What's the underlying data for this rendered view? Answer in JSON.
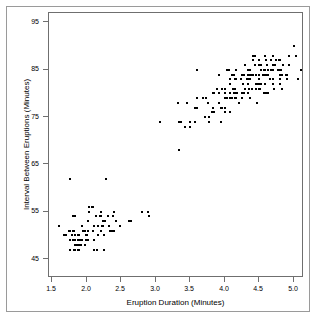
{
  "chart_data": {
    "type": "scatter",
    "title": "",
    "xlabel": "Eruption Duration (Minutes)",
    "ylabel": "Interval Between Eruptions (Minutes)",
    "xlim": [
      1.45,
      5.15
    ],
    "ylim": [
      41,
      97
    ],
    "grid": false,
    "legend": null,
    "marker": "square",
    "marker_color": "#000000",
    "marker_size_px": 2,
    "xticks": [
      1.5,
      2.0,
      2.5,
      3.0,
      3.5,
      4.0,
      4.5,
      5.0
    ],
    "xtick_labels": [
      "1.5",
      "2.0",
      "2.5",
      "3.0",
      "3.5",
      "4.0",
      "4.5",
      "5.0"
    ],
    "yticks": [
      45,
      55,
      65,
      75,
      85,
      95
    ],
    "ytick_labels": [
      "45",
      "55",
      "65",
      "75",
      "85",
      "95"
    ],
    "series": [
      {
        "name": "Old Faithful eruptions",
        "x": [
          3.6,
          1.8,
          3.333,
          2.283,
          4.533,
          2.883,
          4.7,
          3.6,
          1.95,
          4.35,
          1.833,
          3.917,
          4.2,
          1.75,
          4.7,
          2.167,
          1.75,
          4.8,
          1.6,
          4.25,
          1.8,
          1.75,
          3.45,
          3.067,
          4.533,
          3.6,
          1.967,
          4.083,
          3.85,
          4.433,
          4.3,
          4.467,
          3.367,
          4.033,
          3.833,
          2.017,
          1.867,
          4.833,
          1.833,
          4.783,
          4.35,
          1.883,
          4.567,
          1.75,
          4.533,
          3.317,
          3.833,
          2.1,
          4.633,
          2.0,
          4.8,
          4.716,
          1.833,
          4.833,
          1.733,
          4.883,
          3.717,
          1.667,
          4.567,
          4.317,
          2.233,
          4.5,
          1.75,
          4.8,
          1.817,
          4.4,
          4.167,
          4.7,
          2.067,
          4.7,
          4.033,
          1.967,
          4.5,
          4.0,
          1.983,
          5.067,
          2.017,
          4.567,
          3.883,
          3.6,
          4.133,
          4.333,
          4.1,
          2.633,
          4.067,
          4.933,
          3.95,
          4.517,
          2.167,
          4.0,
          2.2,
          4.333,
          1.867,
          4.817,
          1.833,
          4.3,
          4.667,
          3.75,
          1.867,
          4.9,
          2.483,
          4.367,
          2.1,
          4.5,
          4.05,
          1.867,
          4.7,
          1.783,
          4.85,
          3.683,
          4.733,
          2.3,
          4.9,
          4.417,
          1.7,
          4.633,
          2.317,
          4.6,
          1.817,
          4.417,
          2.617,
          4.067,
          4.25,
          1.967,
          4.6,
          3.767,
          1.917,
          4.5,
          2.267,
          4.65,
          1.867,
          4.167,
          2.8,
          4.333,
          1.833,
          4.383,
          1.883,
          4.933,
          2.033,
          3.733,
          4.233,
          2.233,
          4.533,
          4.817,
          4.333,
          1.983,
          4.633,
          2.017,
          5.1,
          1.8,
          5.033,
          4.0,
          2.4,
          4.6,
          3.567,
          4.0,
          4.5,
          4.083,
          1.8,
          3.967,
          2.2,
          4.15,
          2.0,
          3.833,
          3.5,
          4.583,
          2.367,
          5.0,
          1.933,
          4.617,
          1.917,
          2.083,
          4.583,
          3.333,
          4.167,
          4.333,
          4.5,
          2.417,
          4.0,
          4.167,
          1.883,
          4.583,
          4.25,
          3.767,
          2.033,
          4.433,
          4.083,
          1.833,
          4.417,
          2.183,
          4.8,
          1.833,
          4.8,
          4.1,
          3.966,
          4.233,
          3.5,
          4.366,
          2.25,
          4.667,
          2.1,
          4.35,
          4.133,
          1.867,
          4.6,
          1.783,
          4.367,
          3.85,
          1.933,
          4.5,
          2.383,
          4.7,
          1.867,
          3.833,
          3.417,
          4.233,
          2.4,
          4.8,
          2.0,
          4.15,
          1.867,
          4.267,
          1.75,
          4.483,
          4.0,
          4.117,
          4.083,
          4.267,
          3.917,
          4.55,
          4.083,
          2.417,
          4.183,
          2.217,
          4.45,
          1.883,
          1.85,
          4.283,
          3.95,
          2.333,
          4.15,
          2.35,
          4.933,
          2.9,
          4.583,
          3.833,
          2.083,
          4.367,
          2.133,
          4.35,
          2.2,
          4.45,
          3.567,
          4.5,
          4.15,
          3.817,
          3.917,
          4.45,
          2.0,
          4.283,
          4.767,
          4.533,
          1.85,
          4.25,
          1.983,
          2.25,
          4.75,
          4.117,
          2.15,
          4.417,
          1.817,
          4.467
        ],
        "y": [
          79,
          54,
          74,
          62,
          85,
          55,
          88,
          85,
          51,
          85,
          54,
          84,
          78,
          47,
          83,
          52,
          62,
          84,
          52,
          79,
          51,
          47,
          78,
          74,
          85,
          77,
          51,
          80,
          76,
          88,
          81,
          78,
          74,
          79,
          76,
          51,
          47,
          84,
          47,
          87,
          81,
          47,
          80,
          49,
          86,
          78,
          77,
          47,
          80,
          50,
          83,
          81,
          48,
          81,
          51,
          84,
          75,
          50,
          85,
          83,
          52,
          87,
          47,
          85,
          49,
          81,
          83,
          85,
          56,
          86,
          85,
          48,
          81,
          79,
          50,
          83,
          49,
          84,
          81,
          77,
          80,
          80,
          79,
          53,
          85,
          86,
          77,
          81,
          50,
          81,
          54,
          85,
          49,
          85,
          50,
          86,
          85,
          78,
          49,
          84,
          52,
          85,
          52,
          82,
          85,
          49,
          82,
          50,
          86,
          79,
          86,
          54,
          83,
          84,
          50,
          84,
          52,
          87,
          47,
          84,
          53,
          85,
          80,
          51,
          84,
          74,
          49,
          86,
          53,
          83,
          50,
          85,
          55,
          84,
          48,
          84,
          50,
          86,
          56,
          79,
          83,
          53,
          82,
          85,
          83,
          49,
          85,
          53,
          85,
          49,
          88,
          76,
          55,
          80,
          74,
          77,
          83,
          82,
          49,
          81,
          55,
          83,
          50,
          80,
          74,
          85,
          51,
          90,
          52,
          86,
          48,
          56,
          84,
          68,
          83,
          82,
          87,
          53,
          76,
          79,
          48,
          88,
          80,
          75,
          55,
          86,
          83,
          48,
          87,
          54,
          84,
          49,
          82,
          84,
          77,
          83,
          73,
          83,
          50,
          87,
          49,
          85,
          84,
          49,
          84,
          50,
          84,
          80,
          49,
          82,
          54,
          86,
          48,
          76,
          73,
          83,
          51,
          87,
          49,
          79,
          49,
          82,
          51,
          82,
          80,
          81,
          79,
          80,
          78,
          84,
          76,
          53,
          80,
          52,
          84,
          49,
          48,
          80,
          74,
          51,
          80,
          51,
          88,
          54,
          82,
          76,
          51,
          79,
          54,
          81,
          51,
          82,
          77,
          84,
          81,
          76,
          80,
          81,
          49,
          84,
          85,
          86,
          48,
          84,
          50,
          47,
          87,
          81,
          47,
          88,
          51,
          82
        ]
      }
    ]
  },
  "axes": {
    "x_title": "Eruption Duration (Minutes)",
    "y_title": "Interval Between Eruptions (Minutes)"
  }
}
